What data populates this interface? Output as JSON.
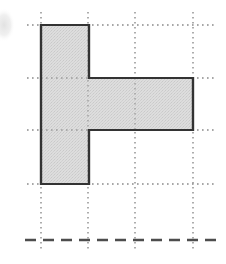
{
  "figure": {
    "kind": "geometry-grid-figure",
    "canvas": {
      "width": 226,
      "height": 264,
      "background": "#ffffff"
    },
    "colors": {
      "paper": "#ffffff",
      "shape_fill": "#d9d9d9",
      "shape_fill_dither": "#c4c4c4",
      "shape_outline": "#333333",
      "grid_line": "#8a8a8a",
      "axis_line": "#4d4d4d",
      "artifact": "#e6e6e6"
    },
    "grid": {
      "style": "dotted",
      "vertical_lines_x": [
        41,
        88,
        135,
        193
      ],
      "horizontal_lines_y": [
        25,
        78,
        130,
        184
      ],
      "vertical_extent_y": [
        12,
        251
      ],
      "horizontal_extent_x": [
        27,
        216
      ],
      "cell_width": 48,
      "cell_height": 53,
      "line_width": 1.4,
      "dash_pattern": "1.6 3.4"
    },
    "axis": {
      "orientation": "horizontal",
      "style": "dashed",
      "y": 240,
      "x_start": 25,
      "x_end": 218,
      "line_width": 2.4,
      "dash_pattern": "11 7"
    },
    "shape": {
      "name": "h-shaped-polygon",
      "description": "Tall vertical rectangle on the left joined to a wide horizontal rectangle on the right",
      "outline_width": 2.2,
      "fill": "#d9d9d9",
      "stroke": "#333333",
      "points": "41,25 89,25 89,78 193,78 193,130 89,130 89,184 41,184",
      "parts": [
        {
          "name": "vertical-bar",
          "x": 41,
          "y": 25,
          "width": 48,
          "height": 159,
          "grid_cells_wide": 1,
          "grid_cells_tall": 3
        },
        {
          "name": "horizontal-bar",
          "x": 89,
          "y": 78,
          "width": 104,
          "height": 52,
          "grid_cells_wide": 2,
          "grid_cells_tall": 1
        }
      ],
      "area_in_cells": 5
    },
    "artifact": {
      "name": "page-scan-smudge",
      "shape": "partial-ellipse",
      "cx": 4,
      "cy": 25,
      "rx": 11,
      "ry": 17,
      "fill": "#e8e8e8"
    }
  }
}
